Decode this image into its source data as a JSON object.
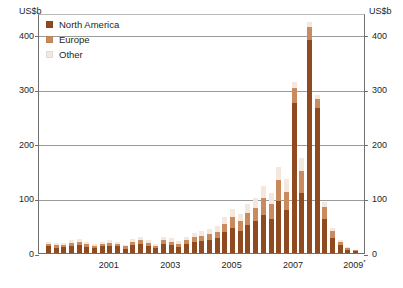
{
  "axes": {
    "unit_left": "US$b",
    "unit_right": "US$b",
    "yticks": [
      0,
      100,
      200,
      300,
      400
    ],
    "xticks": [
      "2001",
      "2003",
      "2005",
      "2007",
      "2009"
    ],
    "xtick_last_superscript": "*"
  },
  "legend": {
    "items": [
      {
        "label": "North America",
        "color": "#8f4a20"
      },
      {
        "label": "Europe",
        "color": "#c98a5e"
      },
      {
        "label": "Other",
        "color": "#f4e7dd"
      }
    ]
  },
  "source_caption": "",
  "chart_data": {
    "type": "bar",
    "stacked": true,
    "title": "",
    "subtitle": "",
    "xlabel": "",
    "ylabel": "US$b",
    "ylim": [
      0,
      440
    ],
    "yticks": [
      0,
      100,
      200,
      300,
      400
    ],
    "grid": true,
    "legend_position": "top-left",
    "x_tick_labels": [
      "2001",
      "2003",
      "2005",
      "2007",
      "2009*"
    ],
    "x_tick_categories": [
      "2001Q1",
      "2003Q1",
      "2005Q1",
      "2007Q1",
      "2009Q1"
    ],
    "categories": [
      "1999Q1",
      "1999Q2",
      "1999Q3",
      "1999Q4",
      "2000Q1",
      "2000Q2",
      "2000Q3",
      "2000Q4",
      "2001Q1",
      "2001Q2",
      "2001Q3",
      "2001Q4",
      "2002Q1",
      "2002Q2",
      "2002Q3",
      "2002Q4",
      "2003Q1",
      "2003Q2",
      "2003Q3",
      "2003Q4",
      "2004Q1",
      "2004Q2",
      "2004Q3",
      "2004Q4",
      "2005Q1",
      "2005Q2",
      "2005Q3",
      "2005Q4",
      "2006Q1",
      "2006Q2",
      "2006Q3",
      "2006Q4",
      "2007Q1",
      "2007Q2",
      "2007Q3",
      "2007Q4",
      "2008Q1",
      "2008Q2",
      "2008Q3",
      "2008Q4",
      "2009Q1"
    ],
    "series": [
      {
        "name": "North America",
        "color": "#8f4a20",
        "values": [
          12,
          10,
          11,
          13,
          14,
          11,
          9,
          12,
          13,
          12,
          8,
          14,
          16,
          13,
          9,
          17,
          14,
          11,
          16,
          20,
          22,
          24,
          27,
          38,
          46,
          40,
          52,
          58,
          70,
          62,
          95,
          78,
          275,
          110,
          390,
          265,
          62,
          28,
          14,
          6,
          3
        ]
      },
      {
        "name": "Europe",
        "color": "#c98a5e",
        "values": [
          5,
          5,
          4,
          6,
          6,
          5,
          4,
          5,
          6,
          5,
          4,
          6,
          7,
          6,
          4,
          7,
          7,
          6,
          7,
          9,
          10,
          11,
          12,
          16,
          20,
          18,
          22,
          25,
          30,
          28,
          38,
          34,
          28,
          40,
          25,
          18,
          22,
          12,
          6,
          3,
          2
        ]
      },
      {
        "name": "Other",
        "color": "#f4e7dd",
        "values": [
          4,
          4,
          4,
          5,
          5,
          4,
          3,
          4,
          5,
          4,
          3,
          5,
          6,
          5,
          3,
          6,
          6,
          5,
          6,
          7,
          8,
          9,
          10,
          12,
          14,
          13,
          16,
          18,
          22,
          20,
          25,
          23,
          10,
          25,
          8,
          6,
          10,
          6,
          3,
          2,
          1
        ]
      }
    ]
  }
}
